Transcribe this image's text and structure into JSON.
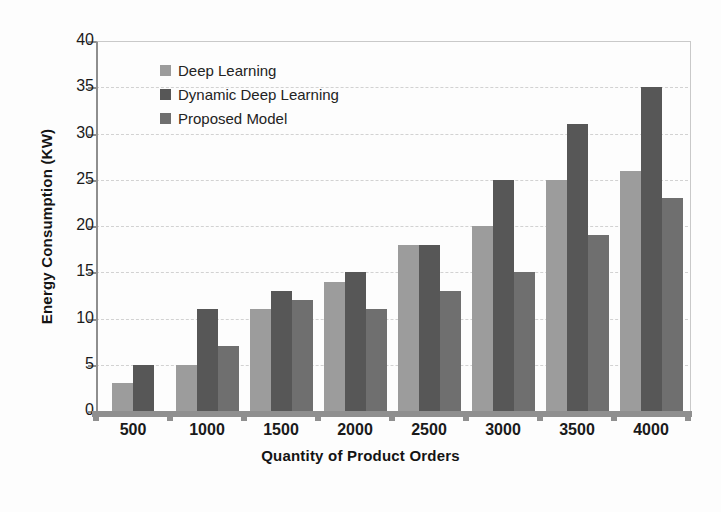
{
  "chart_data": {
    "type": "bar",
    "title": "",
    "xlabel": "Quantity of Product Orders",
    "ylabel": "Energy Consumption (KW)",
    "categories": [
      "500",
      "1000",
      "1500",
      "2000",
      "2500",
      "3000",
      "3500",
      "4000"
    ],
    "series": [
      {
        "name": "Deep Learning",
        "color": "#9c9c9c",
        "values": [
          3,
          5,
          11,
          14,
          18,
          20,
          25,
          26
        ]
      },
      {
        "name": "Dynamic Deep Learning",
        "color": "#575757",
        "values": [
          5,
          11,
          13,
          15,
          18,
          25,
          31,
          35
        ]
      },
      {
        "name": "Proposed Model",
        "color": "#6f6f6f",
        "values": [
          0,
          7,
          12,
          11,
          13,
          15,
          19,
          23
        ]
      }
    ],
    "ylim": [
      0,
      40
    ],
    "ytick_labels": [
      "0",
      "5",
      "10",
      "15",
      "20",
      "25",
      "30",
      "35",
      "40"
    ],
    "ytick_values": [
      0,
      5,
      10,
      15,
      20,
      25,
      30,
      35,
      40
    ],
    "grid": true,
    "legend_position": "upper-left-inside"
  },
  "legend": {
    "items": [
      {
        "label": "Deep Learning"
      },
      {
        "label": "Dynamic Deep Learning"
      },
      {
        "label": "Proposed Model"
      }
    ]
  },
  "axes": {
    "y_title": "Energy Consumption (KW)",
    "x_title": "Quantity of Product Orders"
  }
}
